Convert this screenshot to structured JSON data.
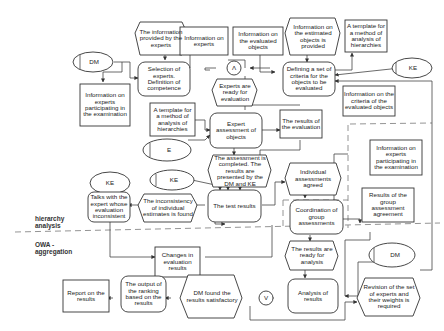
{
  "diagram": {
    "nodes": [
      {
        "id": "info_provided_experts",
        "shape": "hexagon",
        "text": "The information provided by the experts"
      },
      {
        "id": "info_experts",
        "shape": "rect",
        "text": "Information on experts"
      },
      {
        "id": "info_eval_objects",
        "shape": "rect",
        "text": "Information on the evaluated objects"
      },
      {
        "id": "info_estimated_objects",
        "shape": "hexagon",
        "text": "Information on the estimated objects is provided"
      },
      {
        "id": "template_top",
        "shape": "rect",
        "text": "A template for a method of analysis of hierarchies"
      },
      {
        "id": "dm_top",
        "shape": "ellipse",
        "text": "DM"
      },
      {
        "id": "selection_experts",
        "shape": "rounded",
        "text": "Selection of experts. Definition of competence"
      },
      {
        "id": "and_gate",
        "shape": "circle",
        "text": "Λ"
      },
      {
        "id": "defining_criteria",
        "shape": "rounded",
        "text": "Defining a set of criteria for the objects to be evaluated"
      },
      {
        "id": "ke_top",
        "shape": "ellipse",
        "text": "KE"
      },
      {
        "id": "info_participating_left",
        "shape": "rect",
        "text": "Information on experts participating in the examination"
      },
      {
        "id": "experts_ready",
        "shape": "hexagon",
        "text": "Experts are ready for evaluation"
      },
      {
        "id": "info_criteria",
        "shape": "rect",
        "text": "Information on the criteria of the evaluated objects"
      },
      {
        "id": "template_mid",
        "shape": "rect",
        "text": "A template for a method of analysis of hierarchies"
      },
      {
        "id": "expert_assessment",
        "shape": "rounded",
        "text": "Expert assessment of objects"
      },
      {
        "id": "results_evaluation",
        "shape": "rect",
        "text": "The results of the evaluation"
      },
      {
        "id": "e_ellipse",
        "shape": "ellipse",
        "text": "E"
      },
      {
        "id": "assessment_completed",
        "shape": "hexagon",
        "text": "The assessment is completed. The results are presented by the DM and KE"
      },
      {
        "id": "info_participating_right",
        "shape": "rect",
        "text": "Information on experts participating in the examination"
      },
      {
        "id": "ke_left",
        "shape": "ellipse",
        "text": "KE"
      },
      {
        "id": "ke_mid",
        "shape": "ellipse",
        "text": "KE"
      },
      {
        "id": "individual_agreed",
        "shape": "hexagon",
        "text": "Individual assessments agreed"
      },
      {
        "id": "talks_expert",
        "shape": "rounded",
        "text": "Talks with the expert whose evaluation inconsistent"
      },
      {
        "id": "inconsistency",
        "shape": "hexagon",
        "text": "The inconsistency of individual estimates is found"
      },
      {
        "id": "test_results",
        "shape": "rounded",
        "text": "The test results"
      },
      {
        "id": "coordination",
        "shape": "rounded",
        "text": "Coordination of group assessments"
      },
      {
        "id": "group_agreement",
        "shape": "rect",
        "text": "Results of the group assessment agreement"
      },
      {
        "id": "changes_evaluation",
        "shape": "rect",
        "text": "Changes in evaluation results"
      },
      {
        "id": "ready_analysis",
        "shape": "hexagon",
        "text": "The results are ready for analysis"
      },
      {
        "id": "dm_bottom",
        "shape": "ellipse",
        "text": "DM"
      },
      {
        "id": "report",
        "shape": "rect",
        "text": "Report on the results"
      },
      {
        "id": "output_ranking",
        "shape": "rounded",
        "text": "The output of the ranking based on the results"
      },
      {
        "id": "dm_satisfactory",
        "shape": "hexagon",
        "text": "DM found the results satisfactory"
      },
      {
        "id": "or_gate",
        "shape": "circle",
        "text": "V"
      },
      {
        "id": "analysis_results",
        "shape": "rounded",
        "text": "Analysis of results"
      },
      {
        "id": "revision",
        "shape": "hexagon",
        "text": "Revision of the set of experts and their weights is required"
      }
    ],
    "section_labels": {
      "hierarchy": "hierarchy analysis",
      "owa": "OWA - aggregation"
    }
  }
}
